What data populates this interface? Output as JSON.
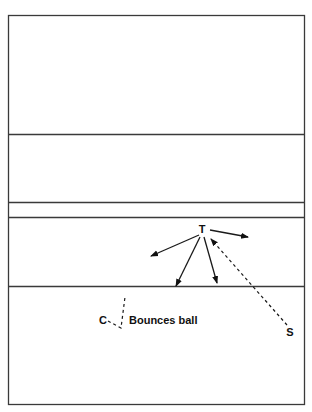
{
  "diagram": {
    "title": "",
    "players": [
      {
        "id": "T",
        "label": "T",
        "x": 202,
        "y": 233
      },
      {
        "id": "S",
        "label": "S",
        "x": 290,
        "y": 336
      },
      {
        "id": "C",
        "label": "C",
        "x": 103,
        "y": 324
      }
    ],
    "annotation": {
      "text": "Bounces ball",
      "x": 129,
      "y": 324
    },
    "court": {
      "outer": {
        "x": 8.5,
        "y": 15.5,
        "width": 296,
        "height": 389
      },
      "horizontal_lines_y": [
        134.5,
        202.5,
        217.5,
        286.5
      ]
    },
    "arrows_from_T": [
      {
        "name": "right",
        "x1": 210,
        "y1": 230,
        "x2": 248,
        "y2": 237
      },
      {
        "name": "left",
        "x1": 199,
        "y1": 235,
        "x2": 151,
        "y2": 256
      },
      {
        "name": "down-left",
        "x1": 200,
        "y1": 237,
        "x2": 176,
        "y2": 286
      },
      {
        "name": "down-right",
        "x1": 204,
        "y1": 237,
        "x2": 217,
        "y2": 283
      }
    ],
    "pass_S_to_T": {
      "x1": 287,
      "y1": 325,
      "x2": 211,
      "y2": 239,
      "style": "dashed"
    },
    "bounce_path": {
      "points": "108,321 121,328 125,297",
      "style": "dashed"
    },
    "colors": {
      "line": "#3a3a3a",
      "ink": "#111111",
      "background": "#ffffff"
    }
  }
}
